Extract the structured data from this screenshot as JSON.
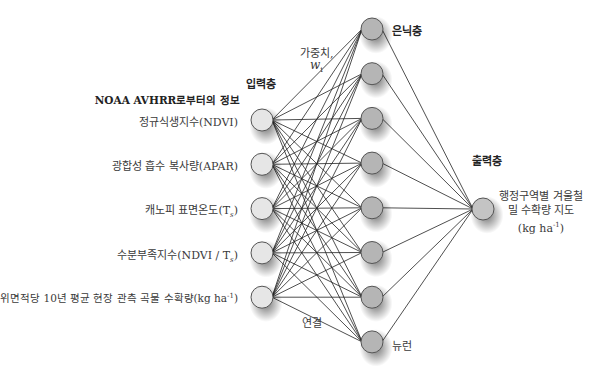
{
  "labels": {
    "input_layer": "입력층",
    "hidden_layer": "은닉층",
    "output_layer": "출력층",
    "weight_label": "가중치,",
    "weight_symbol": "w",
    "weight_sub": "i",
    "connection": "연결",
    "neuron": "뉴런",
    "source_heading": "NOAA AVHRR로부터의 정보"
  },
  "inputs": [
    {
      "text": "정규식생지수(NDVI)"
    },
    {
      "text": "광합성 흡수 복사량(APAR)"
    },
    {
      "text": "캐노피 표면온도(T",
      "sub": "s",
      "tail": ")"
    },
    {
      "text": "수분부족지수(NDVI / T",
      "sub": "s",
      "tail": ")"
    },
    {
      "text": "단위면적당 10년 평균 현장 관측 곡물 수확량(kg ha",
      "sup": "-1",
      "tail": ")"
    }
  ],
  "output": {
    "line1": "행정구역별 겨울철",
    "line2": "밀 수확량 지도",
    "line3": "(kg ha",
    "line3_sup": "-1",
    "line3_tail": ")"
  },
  "network": {
    "input_count": 5,
    "hidden_count": 8,
    "output_count": 1
  },
  "colors": {
    "input_fill": "#e6e6e6",
    "hidden_fill": "#b5b5b5",
    "output_fill": "#c4c4c4",
    "stroke": "#555555",
    "line": "#222222"
  }
}
